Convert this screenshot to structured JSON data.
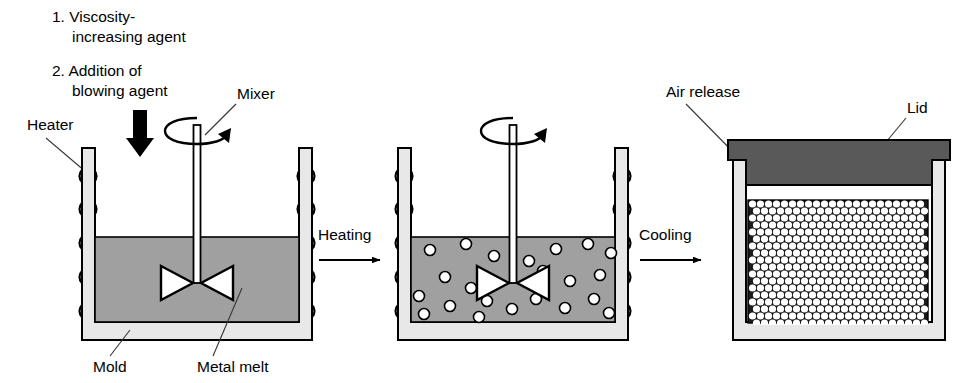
{
  "figure": {
    "background_color": "#ffffff",
    "line_color": "#000000"
  },
  "colors": {
    "mold_wall": "#e8e8e8",
    "mold_wall_shadow": "#bfbfbf",
    "metal_melt": "#a0a0a0",
    "lid": "#595959",
    "foam_matrix": "#1a1a1a",
    "bubble": "#ffffff",
    "leader_line": "#3a3a3a",
    "arrow_black": "#000000"
  },
  "annotations": {
    "step1_line1": "1. Viscosity-",
    "step1_line2": "increasing agent",
    "step2_line1": "2. Addition of",
    "step2_line2": "blowing agent",
    "heater": "Heater",
    "mixer": "Mixer",
    "mold": "Mold",
    "metal_melt": "Metal melt",
    "air_release": "Air release",
    "lid": "Lid"
  },
  "process_arrows": [
    {
      "label": "Heating",
      "x": 312,
      "y": 238,
      "length": 62
    },
    {
      "label": "Cooling",
      "x": 633,
      "y": 238,
      "length": 62
    }
  ],
  "stages": [
    {
      "name": "stage-1-melting-and-addition",
      "index": 1,
      "vessel": {
        "outer_left": 82,
        "outer_right": 312,
        "outer_top": 148,
        "outer_bottom": 340,
        "wall_thickness": 13
      },
      "melt": {
        "level_y": 237,
        "fill": "#a0a0a0"
      },
      "heater_coils_per_side": 5,
      "has_mixer": true,
      "has_rotation_arrow": true,
      "has_blowing_agent_arrow": true,
      "bubble_count": 0,
      "has_lid": false,
      "has_foam": false
    },
    {
      "name": "stage-2-heating-foaming",
      "index": 2,
      "vessel": {
        "outer_left": 398,
        "outer_right": 628,
        "outer_top": 148,
        "outer_bottom": 340,
        "wall_thickness": 13
      },
      "melt": {
        "level_y": 237,
        "fill": "#a0a0a0"
      },
      "heater_coils_per_side": 5,
      "has_mixer": true,
      "has_rotation_arrow": true,
      "has_blowing_agent_arrow": false,
      "bubble_count": 22,
      "has_lid": false,
      "has_foam": false
    },
    {
      "name": "stage-3-cooling-solidified-foam",
      "index": 3,
      "vessel": {
        "outer_left": 733,
        "outer_right": 945,
        "outer_top": 152,
        "outer_bottom": 340,
        "wall_thickness": 13
      },
      "melt": {
        "level_y": 200,
        "fill": "#1a1a1a"
      },
      "heater_coils_per_side": 0,
      "has_mixer": false,
      "has_rotation_arrow": false,
      "has_blowing_agent_arrow": false,
      "bubble_count": 0,
      "has_lid": true,
      "has_foam": true
    }
  ],
  "bubbles_stage2": [
    {
      "cx": 430,
      "cy": 250,
      "r": 5.5
    },
    {
      "cx": 466,
      "cy": 244,
      "r": 5.5
    },
    {
      "cx": 494,
      "cy": 256,
      "r": 5.5
    },
    {
      "cx": 529,
      "cy": 261,
      "r": 5.5
    },
    {
      "cx": 556,
      "cy": 249,
      "r": 5.5
    },
    {
      "cx": 588,
      "cy": 244,
      "r": 5.5
    },
    {
      "cx": 611,
      "cy": 253,
      "r": 5.5
    },
    {
      "cx": 445,
      "cy": 277,
      "r": 5.5
    },
    {
      "cx": 471,
      "cy": 288,
      "r": 5.5
    },
    {
      "cx": 543,
      "cy": 271,
      "r": 5.5
    },
    {
      "cx": 570,
      "cy": 281,
      "r": 5.5
    },
    {
      "cx": 600,
      "cy": 275,
      "r": 5.5
    },
    {
      "cx": 419,
      "cy": 296,
      "r": 5.5
    },
    {
      "cx": 450,
      "cy": 306,
      "r": 5.5
    },
    {
      "cx": 487,
      "cy": 301,
      "r": 5.5
    },
    {
      "cx": 512,
      "cy": 309,
      "r": 5.5
    },
    {
      "cx": 536,
      "cy": 299,
      "r": 5.5
    },
    {
      "cx": 565,
      "cy": 308,
      "r": 5.5
    },
    {
      "cx": 594,
      "cy": 299,
      "r": 5.5
    },
    {
      "cx": 424,
      "cy": 314,
      "r": 5.5
    },
    {
      "cx": 479,
      "cy": 317,
      "r": 5.5
    },
    {
      "cx": 609,
      "cy": 313,
      "r": 5.5
    }
  ],
  "foam_pattern": {
    "region": {
      "x": 748,
      "y": 200,
      "width": 180,
      "height": 125
    },
    "cell_radius": 3.6,
    "col_spacing": 8.0,
    "row_spacing": 7.0,
    "packing": "hexagonal-staggered"
  },
  "mixer": {
    "shaft_width": 7,
    "shaft_top_y": 125,
    "impeller_half_width": 36,
    "impeller_half_height": 17,
    "impeller_center_y": 283
  },
  "lid": {
    "flange_left": 728,
    "flange_right": 950,
    "flange_top": 140,
    "flange_bottom": 160,
    "plug_left": 746,
    "plug_right": 932,
    "plug_bottom": 185
  },
  "blowing_agent_arrow": {
    "x": 140,
    "y_top": 110,
    "y_bottom": 156,
    "shaft_width": 14,
    "head_width": 28
  }
}
